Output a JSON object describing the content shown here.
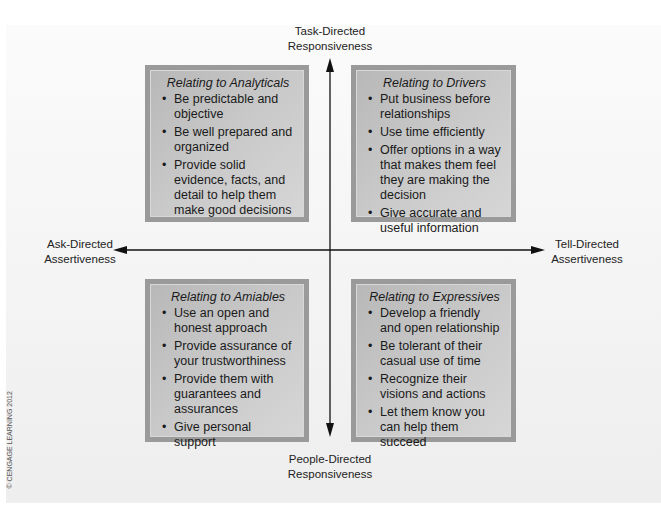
{
  "axes": {
    "top": {
      "line1": "Task-Directed",
      "line2": "Responsiveness"
    },
    "bottom": {
      "line1": "People-Directed",
      "line2": "Responsiveness"
    },
    "left": {
      "line1": "Ask-Directed",
      "line2": "Assertiveness"
    },
    "right": {
      "line1": "Tell-Directed",
      "line2": "Assertiveness"
    }
  },
  "quadrants": {
    "analyticals": {
      "title": "Relating to Analyticals",
      "items": [
        "Be predictable and objective",
        "Be well prepared and organized",
        "Provide solid evidence, facts, and detail to help them make good decisions"
      ]
    },
    "drivers": {
      "title": "Relating to Drivers",
      "items": [
        "Put business before relationships",
        "Use time efficiently",
        "Offer options in a way that makes them feel they are making the decision",
        "Give accurate and useful information"
      ]
    },
    "amiables": {
      "title": "Relating to Amiables",
      "items": [
        "Use an open and honest approach",
        "Provide assurance of your trustworthiness",
        "Provide them with guarantees and assurances",
        "Give personal support"
      ]
    },
    "expressives": {
      "title": "Relating to Expressives",
      "items": [
        "Develop a friendly and open relationship",
        "Be tolerant of their casual use of time",
        "Recognize their visions and actions",
        "Let them know you can help them succeed"
      ]
    }
  },
  "copyright": "© CENGAGE LEARNING 2012",
  "colors": {
    "box_border": "#9a9a9a",
    "box_fill": "#c4c4c4",
    "axis": "#111111",
    "background": "#f2f2f2"
  }
}
